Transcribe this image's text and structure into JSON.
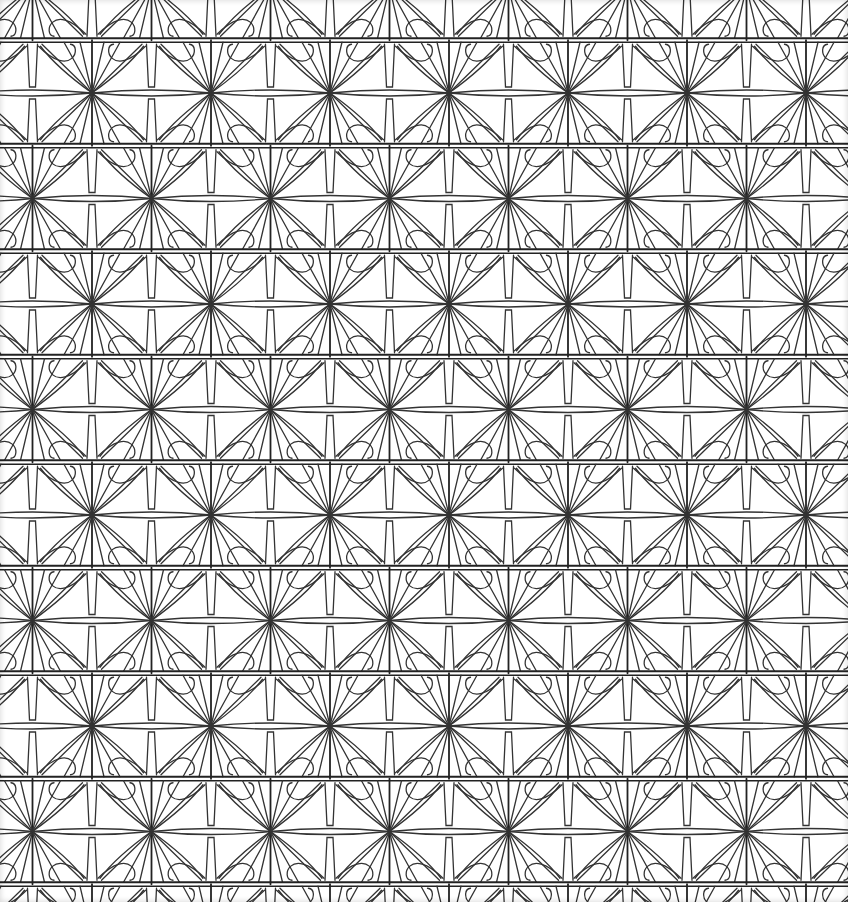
{
  "image": {
    "kind": "geometric-line-art-pattern",
    "width": 848,
    "height": 902,
    "background": "#ffffff",
    "stroke": "#333333",
    "band_stroke": "#222222"
  },
  "pattern": {
    "period_x": 119,
    "period_y": 105.5,
    "stagger_x": 59.5,
    "first_star_x": 92,
    "first_star_y": 93,
    "star_rays": 12,
    "rows": 9,
    "motifs": [
      "radial-star",
      "horizontal-band",
      "petal-arc",
      "tapered-strut"
    ]
  }
}
